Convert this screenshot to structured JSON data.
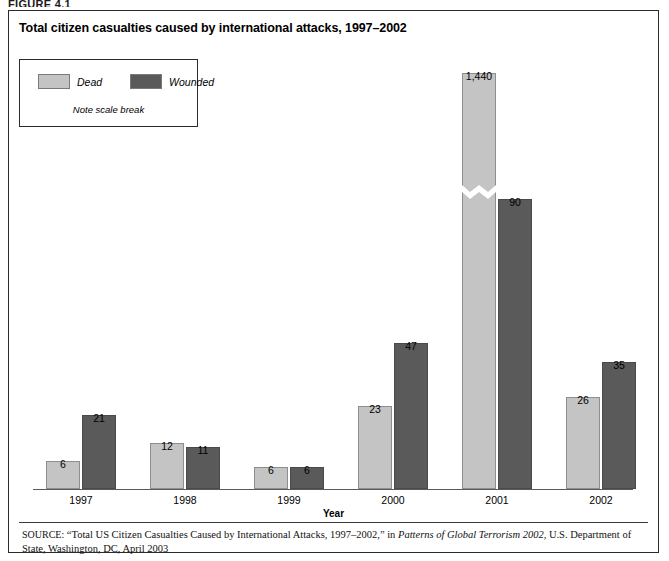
{
  "figure_label": "FIGURE 4.1",
  "title": "Total citizen casualties caused by international attacks, 1997–2002",
  "legend": {
    "items": [
      {
        "label": "Dead",
        "color": "#c4c4c4"
      },
      {
        "label": "Wounded",
        "color": "#5a5a5a"
      }
    ],
    "note": "Note scale break"
  },
  "axis": {
    "xlabel": "Year"
  },
  "source": {
    "prefix": "SOURCE:",
    "text_before_italic": " “Total US Citizen Casualties Caused by International Attacks, 1997–2002,” in ",
    "italic": "Patterns of Global Terrorism 2002",
    "text_after_italic": ", U.S. Department of State, Washington, DC, April 2003"
  },
  "chart_data": {
    "type": "bar",
    "title": "Total citizen casualties caused by international attacks, 1997–2002",
    "xlabel": "Year",
    "ylabel": "",
    "categories": [
      "1997",
      "1998",
      "1999",
      "2000",
      "2001",
      "2002"
    ],
    "series": [
      {
        "name": "Dead",
        "color": "#c4c4c4",
        "values": [
          6,
          12,
          6,
          23,
          1440,
          26
        ],
        "labels": [
          "6",
          "12",
          "6",
          "23",
          "1,440",
          "26"
        ]
      },
      {
        "name": "Wounded",
        "color": "#5a5a5a",
        "values": [
          21,
          11,
          6,
          47,
          90,
          35
        ],
        "labels": [
          "21",
          "11",
          "6",
          "47",
          "90",
          "35"
        ]
      }
    ],
    "grid": false,
    "legend_position": "top-left",
    "scale_break": {
      "present": true,
      "category": "2001",
      "series": "Dead",
      "note": "Note scale break"
    },
    "axis_line": "baseline-only"
  },
  "geometry": {
    "groups": [
      {
        "year": "1997",
        "left": 27,
        "dead_h": 28,
        "wounded_h": 74,
        "dead_label_y": 423,
        "wounded_label_y": 377
      },
      {
        "year": "1998",
        "left": 131,
        "dead_h": 46,
        "wounded_h": 42,
        "dead_label_y": 405,
        "wounded_label_y": 409
      },
      {
        "year": "1999",
        "left": 235,
        "dead_h": 22,
        "wounded_h": 22,
        "dead_label_y": 429,
        "wounded_label_y": 429
      },
      {
        "year": "2000",
        "left": 339,
        "dead_h": 83,
        "wounded_h": 146,
        "dead_label_y": 368,
        "wounded_label_y": 305
      },
      {
        "year": "2001",
        "left": 443,
        "dead_h": 416,
        "wounded_h": 290,
        "dead_label_y": 35,
        "wounded_label_y": 161
      },
      {
        "year": "2002",
        "left": 547,
        "dead_h": 92,
        "wounded_h": 127,
        "dead_label_y": 359,
        "wounded_label_y": 324
      }
    ],
    "scale_break_bottom": 290
  }
}
